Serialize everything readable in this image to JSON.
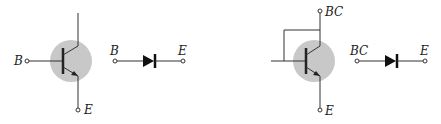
{
  "colors": {
    "line": "#333333",
    "shade": "#c8c8c8",
    "background": "#ffffff"
  },
  "left_circuit": {
    "transistor": {
      "base_label": "B",
      "emitter_label": "E"
    },
    "diode_equivalent": {
      "anode_label": "B",
      "cathode_label": "E"
    }
  },
  "right_circuit": {
    "transistor": {
      "collector_label": "BC",
      "emitter_label": "E"
    },
    "diode_equivalent": {
      "anode_label": "BC",
      "cathode_label": "E"
    }
  }
}
